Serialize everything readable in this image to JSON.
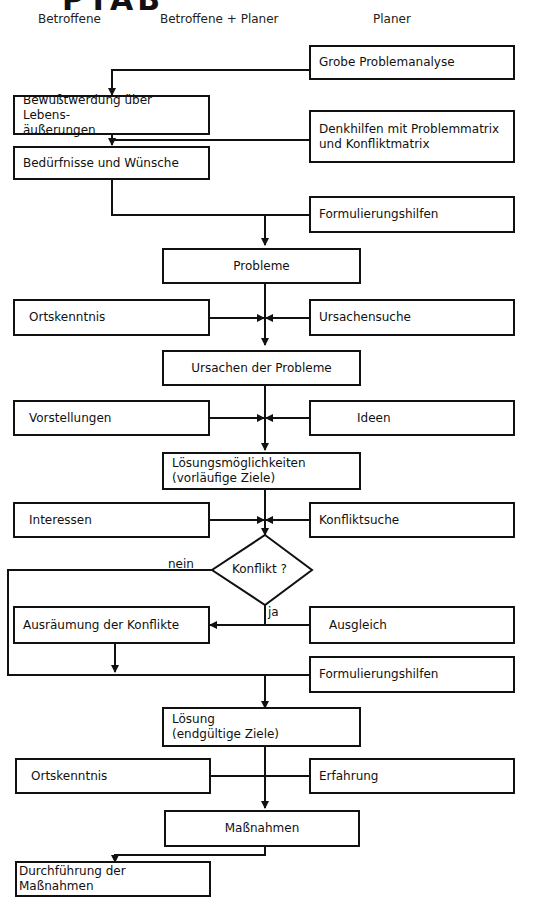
{
  "title_fragment": "PTAB",
  "columns": {
    "left": "Betroffene",
    "middle": "Betroffene + Planer",
    "right": "Planer"
  },
  "nodes": {
    "grobe_problemanalyse": "Grobe Problemanalyse",
    "bewusstwerdung_1": "Bewußtwerdung über Lebens-",
    "bewusstwerdung_2": "äußerungen",
    "denkhilfen_1": "Denkhilfen mit Problemmatrix",
    "denkhilfen_2": "und Konfliktmatrix",
    "beduerfnisse": "Bedürfnisse und Wünsche",
    "formulierungshilfen_1": "Formulierungshilfen",
    "probleme": "Probleme",
    "ortskenntnis_1": "Ortskenntnis",
    "ursachensuche": "Ursachensuche",
    "ursachen": "Ursachen der Probleme",
    "vorstellungen": "Vorstellungen",
    "ideen": "Ideen",
    "loesungsmoeglichkeiten_1": "Lösungsmöglichkeiten",
    "loesungsmoeglichkeiten_2": "(vorläufige Ziele)",
    "interessen": "Interessen",
    "konfliktsuche": "Konfliktsuche",
    "konflikt": "Konflikt ?",
    "ausraeumung": "Ausräumung der Konflikte",
    "ausgleich": "Ausgleich",
    "formulierungshilfen_2": "Formulierungshilfen",
    "loesung_1": "Lösung",
    "loesung_2": "(endgültige Ziele)",
    "ortskenntnis_2": "Ortskenntnis",
    "erfahrung": "Erfahrung",
    "massnahmen": "Maßnahmen",
    "durchfuehrung": "Durchführung der Maßnahmen"
  },
  "edge_labels": {
    "no": "nein",
    "yes": "ja"
  },
  "colors": {
    "stroke": "#111111",
    "background": "#ffffff"
  }
}
